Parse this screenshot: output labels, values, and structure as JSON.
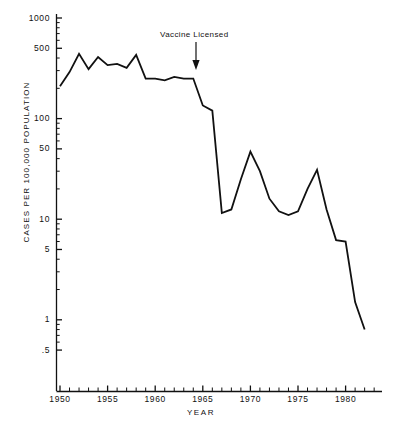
{
  "chart_data": {
    "type": "line",
    "title": "",
    "xlabel": "YEAR",
    "ylabel": "CASES PER 100,000 POPULATION",
    "yscale": "log",
    "ylim": [
      0.5,
      1000
    ],
    "xlim": [
      1949,
      1983
    ],
    "grid": false,
    "legend": null,
    "y_tick_values": [
      1000,
      500,
      100,
      50,
      10,
      5,
      1,
      0.5
    ],
    "y_tick_labels": [
      "1000",
      "500",
      "100",
      "50",
      "10",
      "5",
      "1",
      ".5"
    ],
    "x_tick_labels": [
      "1950",
      "1955",
      "1960",
      "1965",
      "1970",
      "1975",
      "1980"
    ],
    "x_tick_values": [
      1950,
      1955,
      1960,
      1965,
      1970,
      1975,
      1980
    ],
    "x_minor_tick_step": 1,
    "line_color": "#111111",
    "line_width": 1.8,
    "annotations": [
      {
        "text": "Vaccine Licensed",
        "x": 1963,
        "y": 240,
        "arrow": true,
        "label_x_px": 160,
        "label_y_px": 30,
        "arrow_x_px": 196,
        "arrow_y_top_px": 42,
        "arrow_y_bottom_px": 70
      }
    ],
    "x": [
      1950,
      1951,
      1952,
      1953,
      1954,
      1955,
      1956,
      1957,
      1958,
      1959,
      1960,
      1961,
      1962,
      1963,
      1964,
      1965,
      1966,
      1967,
      1968,
      1969,
      1970,
      1971,
      1972,
      1973,
      1974,
      1975,
      1976,
      1977,
      1978,
      1979,
      1980,
      1981,
      1982
    ],
    "values": [
      210,
      290,
      440,
      310,
      410,
      340,
      350,
      320,
      430,
      250,
      250,
      240,
      260,
      250,
      250,
      135,
      120,
      11.5,
      12.5,
      25,
      47,
      30,
      16,
      12,
      11,
      12,
      20,
      31,
      12.5,
      6.2,
      6.0,
      1.5,
      0.8
    ],
    "series": [
      {
        "name": "Measles cases per 100,000 population",
        "values": [
          210,
          290,
          440,
          310,
          410,
          340,
          350,
          320,
          430,
          250,
          250,
          240,
          260,
          250,
          250,
          135,
          120,
          11.5,
          12.5,
          25,
          47,
          30,
          16,
          12,
          11,
          12,
          20,
          31,
          12.5,
          6.2,
          6.0,
          1.5,
          0.8
        ]
      }
    ]
  },
  "axis": {
    "y_title": "CASES PER 100,000 POPULATION",
    "x_title": "YEAR"
  },
  "annotation": {
    "vaccine_label": "Vaccine Licensed"
  }
}
